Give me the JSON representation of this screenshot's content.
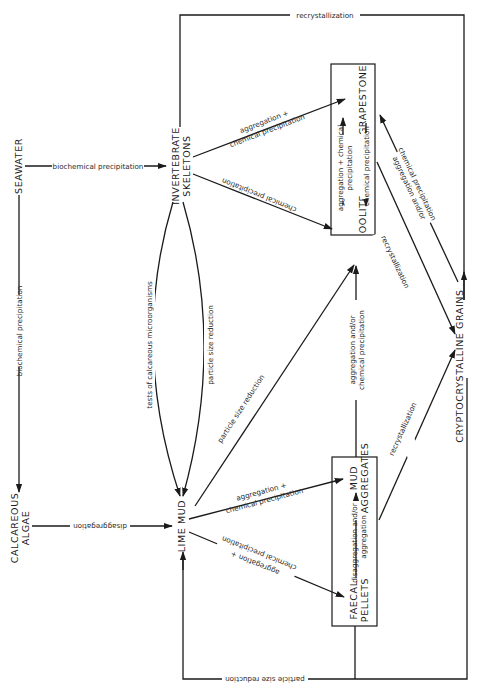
{
  "diagram": {
    "orientation": "rotated 90 degrees clockwise",
    "nodes": {
      "seawater": "SEAWATER",
      "invertebrate_skeletons_1": "INVERTEBRATE",
      "invertebrate_skeletons_2": "SKELETONS",
      "calcareous_algae_1": "CALCAREOUS",
      "calcareous_algae_2": "ALGAE",
      "lime_mud": "LIME MUD",
      "grapestone": "GRAPESTONE",
      "oolite": "OOLITE",
      "mud_aggregates_1": "MUD",
      "mud_aggregates_2": "AGGREGATES",
      "faecal_pellets_1": "FAECAL",
      "faecal_pellets_2": "PELLETS",
      "cryptocrystalline_grains": "CRYPTOCRYSTALLINE   GRAINS"
    },
    "edges": {
      "recrystallization_top": "recrystallization",
      "seawater_to_skeletons": "biochemical precipitation",
      "seawater_to_algae": "biochemical precipitation",
      "skeletons_to_grapestone_1": "aggregation +",
      "skeletons_to_grapestone_2": "chemical precipitation",
      "skeletons_to_oolite": "chemical precipitation",
      "tests_microorganisms": "tests of calcareous microorganisms",
      "skeletons_particle_size": "particle size reduction",
      "oolite_grapestone_1": "aggregation + chemical",
      "oolite_grapestone_2": "precipitation",
      "grapestone_oolite": "chemical precipitation",
      "grapestone_crypto_1": "aggregation and/or",
      "grapestone_crypto_2": "chemical precipitation",
      "oolite_crypto": "recrystallization",
      "lime_mud_to_oolite": "particle size reduction",
      "mud_agg_to_oolite_1": "aggregation and/or",
      "mud_agg_to_oolite_2": "chemical precipitation",
      "mud_agg_to_crypto": "recrystallization",
      "algae_to_lime_mud": "disaggregation",
      "lime_mud_to_mud_agg_1": "aggregation +",
      "lime_mud_to_mud_agg_2": "chemical precipitation",
      "lime_mud_to_pellets_1": "chemical precipitation",
      "lime_mud_to_pellets_2": "aggregation +",
      "pellets_mud_agg_1": "disaggregation and/or",
      "pellets_mud_agg_2": "aggregation",
      "particle_size_bottom": "particle size reduction"
    }
  }
}
